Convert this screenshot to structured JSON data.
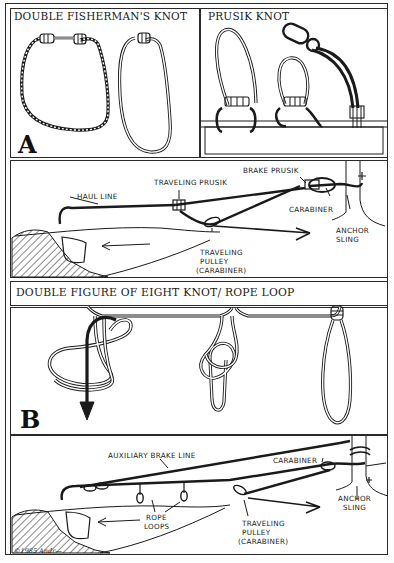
{
  "figure": {
    "section_a": {
      "letter": "A",
      "left_panel": {
        "title": "DOUBLE FISHERMAN'S KNOT"
      },
      "right_panel": {
        "title": "PRUSIK KNOT"
      },
      "haul_diagram": {
        "labels": {
          "haul_line": "HAUL LINE",
          "traveling_prusik": "TRAVELING PRUSIK",
          "brake_prusik": "BRAKE PRUSIK",
          "carabiner": "CARABINER",
          "anchor_sling_1": "ANCHOR",
          "anchor_sling_2": "SLING",
          "pulley_1": "TRAVELING",
          "pulley_2": "PULLEY",
          "pulley_3": "(CARABINER)"
        }
      }
    },
    "section_b": {
      "letter": "B",
      "header": {
        "title": "DOUBLE FIGURE OF EIGHT KNOT/ ROPE LOOP"
      },
      "haul_diagram": {
        "labels": {
          "auxiliary_brake_line": "AUXILIARY BRAKE LINE",
          "carabiner": "CARABINER",
          "anchor_sling_1": "ANCHOR",
          "anchor_sling_2": "SLING",
          "rope_loops_1": "ROPE",
          "rope_loops_2": "LOOPS",
          "pulley_1": "TRAVELING",
          "pulley_2": "PULLEY",
          "pulley_3": "(CARABINER)"
        }
      }
    },
    "copyright": "©1985 Andr—"
  },
  "colors": {
    "ink": "#1a1a1a",
    "paper": "#ffffff",
    "frame": "#2a2a2a"
  }
}
